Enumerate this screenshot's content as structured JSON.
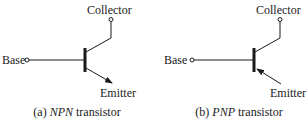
{
  "figure": {
    "panels": [
      {
        "id": "a",
        "type": "NPN",
        "labels": {
          "collector": "Collector",
          "base": "Base",
          "emitter": "Emitter"
        },
        "caption": {
          "prefix": "(a) ",
          "type": "NPN",
          "suffix": " transistor"
        },
        "arrow_direction": "outward"
      },
      {
        "id": "b",
        "type": "PNP",
        "labels": {
          "collector": "Collector",
          "base": "Base",
          "emitter": "Emitter"
        },
        "caption": {
          "prefix": "(b) ",
          "type": "PNP",
          "suffix": " transistor"
        },
        "arrow_direction": "inward"
      }
    ],
    "colors": {
      "stroke": "#1a1a1a",
      "background": "#ffffff"
    }
  }
}
